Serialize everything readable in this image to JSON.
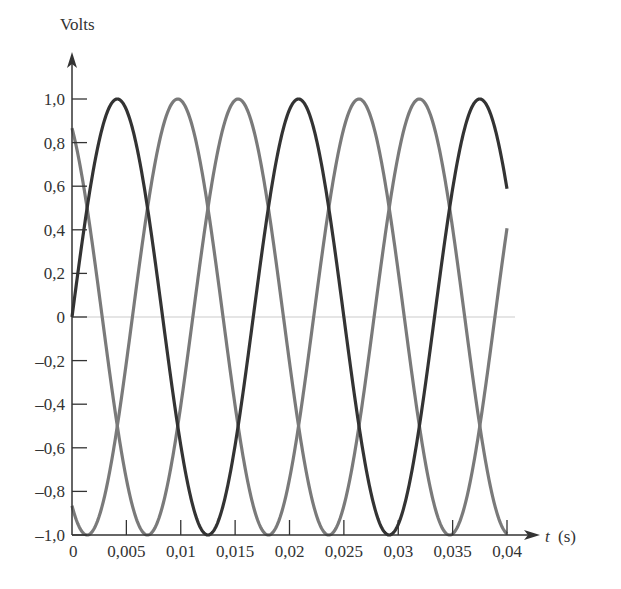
{
  "chart_data": {
    "type": "line",
    "title": "",
    "xlabel": "t (s)",
    "xlabel_var": "t",
    "xlabel_unit": "(s)",
    "ylabel": "Volts",
    "xlim": [
      0,
      0.04
    ],
    "ylim": [
      -1.0,
      1.0
    ],
    "grid": false,
    "legend": null,
    "x_ticks": [
      0,
      0.005,
      0.01,
      0.015,
      0.02,
      0.025,
      0.03,
      0.035,
      0.04
    ],
    "x_tick_labels": [
      "0",
      "0,005",
      "0,01",
      "0,015",
      "0,02",
      "0,025",
      "0,03",
      "0,035",
      "0,04"
    ],
    "y_ticks": [
      1.0,
      0.8,
      0.6,
      0.4,
      0.2,
      0,
      -0.2,
      -0.4,
      -0.6,
      -0.8,
      -1.0
    ],
    "y_tick_labels": [
      "1,0",
      "0,8",
      "0,6",
      "0,4",
      "0,2",
      "0",
      "–0,2",
      "–0,4",
      "–0,6",
      "–0,8",
      "–1,0"
    ],
    "frequency_hz": 60,
    "amplitude": 1.0,
    "series": [
      {
        "name": "va",
        "formula": "sin(2π·60t)",
        "phase_deg": 0,
        "color": "#333333",
        "x": [
          0,
          0.005,
          0.01,
          0.015,
          0.02,
          0.025,
          0.03,
          0.035,
          0.04
        ],
        "values": [
          0,
          0.95,
          -0.59,
          -0.59,
          0.95,
          0,
          -0.95,
          0.59,
          0.59
        ]
      },
      {
        "name": "vb",
        "formula": "sin(2π·60t − 120°)",
        "phase_deg": -120,
        "color": "#7a7a7a",
        "x": [
          0,
          0.005,
          0.01,
          0.015,
          0.02,
          0.025,
          0.03,
          0.035,
          0.04
        ],
        "values": [
          -0.87,
          0.34,
          0.5,
          -0.98,
          0.67,
          0.87,
          -0.34,
          -0.5,
          0.41
        ]
      },
      {
        "name": "vc",
        "formula": "sin(2π·60t + 120°)",
        "phase_deg": 120,
        "color": "#7a7a7a",
        "x": [
          0,
          0.005,
          0.01,
          0.015,
          0.02,
          0.025,
          0.03,
          0.035,
          0.04
        ],
        "values": [
          0.87,
          -0.99,
          0.1,
          0.95,
          -0.67,
          -0.87,
          0.67,
          0.91,
          -0.99
        ]
      }
    ],
    "zero_line": true
  },
  "colors": {
    "axis": "#333333",
    "zero_line": "#cccccc",
    "dark_series": "#333333",
    "gray_series": "#7a7a7a"
  }
}
